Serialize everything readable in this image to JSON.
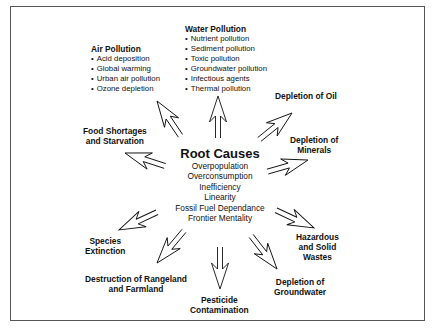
{
  "root": {
    "title": "Root Causes",
    "causes": [
      "Overpopulation",
      "Overconsumption",
      "Inefficiency",
      "Linearity",
      "Fossil Fuel Dependance",
      "Frontier Mentality"
    ]
  },
  "effects": {
    "air_pollution": {
      "title": "Air Pollution",
      "items": [
        "Acid deposition",
        "Global warming",
        "Urban air pollution",
        "Ozone depletion"
      ]
    },
    "water_pollution": {
      "title": "Water Pollution",
      "items": [
        "Nutrient pollution",
        "Sediment pollution",
        "Toxic pollution",
        "Groundwater pollution",
        "Infectious agents",
        "Thermal pollution"
      ]
    },
    "depletion_oil": {
      "line1": "Depletion of Oil"
    },
    "depletion_minerals": {
      "line1": "Depletion of",
      "line2": "Minerals"
    },
    "food_shortages": {
      "line1": "Food Shortages",
      "line2": "and Starvation"
    },
    "hazardous_wastes": {
      "line1": "Hazardous",
      "line2": "and Solid",
      "line3": "Wastes"
    },
    "species_extinction": {
      "line1": "Species",
      "line2": "Extinction"
    },
    "rangeland": {
      "line1": "Destruction of Rangeland",
      "line2": "and Farmland"
    },
    "pesticide": {
      "line1": "Pesticide",
      "line2": "Contamination"
    },
    "groundwater": {
      "line1": "Depletion of",
      "line2": "Groundwater"
    }
  },
  "colors": {
    "ink": "#111111",
    "border": "#555555",
    "background": "#ffffff"
  }
}
